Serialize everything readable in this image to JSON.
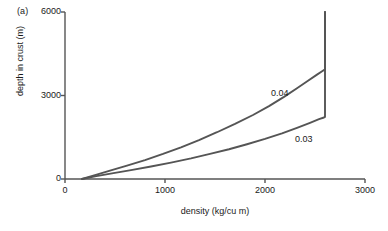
{
  "figure": {
    "panel_label": "(a)",
    "accent_color": "#555555",
    "axis_color": "#555555",
    "text_color": "#1a1a1a",
    "background": "#ffffff"
  },
  "chart_data": {
    "type": "line",
    "title": "",
    "subtitle": "",
    "panel": "(a)",
    "xlabel": "density (kg/cu m)",
    "ylabel": "depth in crust (m)",
    "xlim": [
      0,
      3000
    ],
    "ylim": [
      0,
      6000
    ],
    "xticks": [
      0,
      1000,
      2000,
      3000
    ],
    "xtick_labels": [
      "0",
      "1000",
      "2000",
      "3000"
    ],
    "yticks": [
      0,
      3000,
      6000
    ],
    "ytick_labels": [
      "0",
      "3000",
      "6000"
    ],
    "grid": false,
    "legend": "inline-annotations",
    "legend_position": "inside-right",
    "annotations": [
      {
        "text": "0.04",
        "x": 2180,
        "y": 3050
      },
      {
        "text": "0.03",
        "x": 2420,
        "y": 1400
      }
    ],
    "asymptote_density": 2600,
    "series": [
      {
        "name": "0.04",
        "label": "0.04",
        "color": "#555555",
        "points": [
          [
            170,
            0
          ],
          [
            300,
            140
          ],
          [
            450,
            300
          ],
          [
            620,
            480
          ],
          [
            800,
            680
          ],
          [
            980,
            900
          ],
          [
            1160,
            1140
          ],
          [
            1340,
            1400
          ],
          [
            1520,
            1680
          ],
          [
            1700,
            1980
          ],
          [
            1880,
            2300
          ],
          [
            2040,
            2620
          ],
          [
            2190,
            2950
          ],
          [
            2320,
            3260
          ],
          [
            2430,
            3530
          ],
          [
            2520,
            3750
          ],
          [
            2575,
            3880
          ],
          [
            2600,
            3940
          ],
          [
            2600,
            6000
          ]
        ]
      },
      {
        "name": "0.03",
        "label": "0.03",
        "color": "#555555",
        "points": [
          [
            170,
            0
          ],
          [
            300,
            95
          ],
          [
            470,
            200
          ],
          [
            660,
            320
          ],
          [
            860,
            450
          ],
          [
            1060,
            590
          ],
          [
            1260,
            740
          ],
          [
            1450,
            900
          ],
          [
            1640,
            1070
          ],
          [
            1820,
            1250
          ],
          [
            2000,
            1440
          ],
          [
            2170,
            1640
          ],
          [
            2320,
            1840
          ],
          [
            2450,
            2020
          ],
          [
            2540,
            2150
          ],
          [
            2590,
            2210
          ],
          [
            2600,
            2230
          ],
          [
            2600,
            6000
          ]
        ]
      }
    ]
  }
}
